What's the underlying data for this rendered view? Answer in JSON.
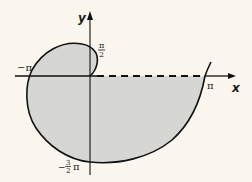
{
  "diagram": {
    "type": "polar spiral region",
    "axes": {
      "x_label": "x",
      "y_label": "y"
    },
    "labels": {
      "pi_half_num": "π",
      "pi_half_den": "2",
      "neg_pi": "−π",
      "pi": "π",
      "neg_three_half_pi_prefix": "−",
      "neg_three_half_pi_num": "3",
      "neg_three_half_pi_den": "2",
      "neg_three_half_pi_suffix": "π"
    },
    "colors": {
      "background": "#fbf7ef",
      "fill": "#d6d6d4",
      "stroke": "#111111"
    }
  }
}
